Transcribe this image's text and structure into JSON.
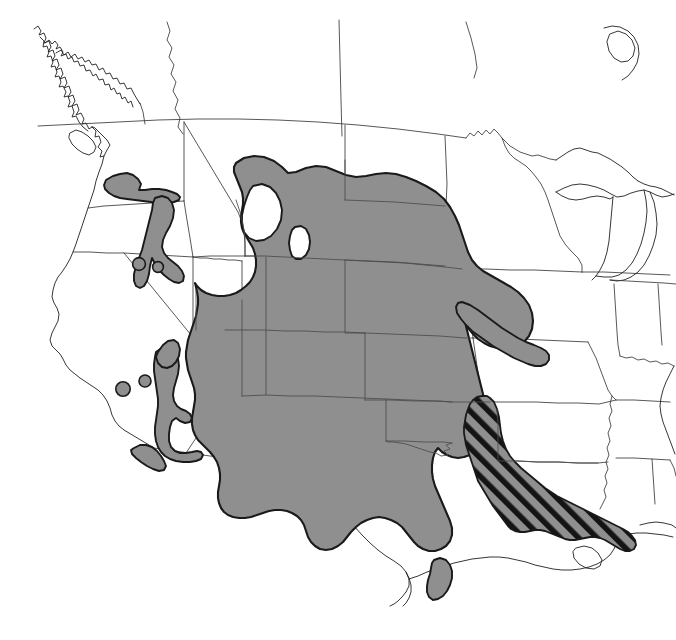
{
  "figure": {
    "kind": "species-range-map",
    "region": "Western and central North America",
    "background_color": "#ffffff",
    "width": 676,
    "height": 640
  },
  "legend_colors": {
    "primary_range_fill": "#8f8f8f",
    "primary_range_outline": "#1a1a1a",
    "hatched_range_fill": "#8f8f8f",
    "hatched_range_hatch": "#1a1a1a",
    "coastline": "#231f20",
    "state_boundary": "#3a3a3a",
    "water_or_gap_fill": "#ffffff"
  },
  "layers": [
    {
      "name": "primary-range",
      "label": "Primary range (solid gray)",
      "fill": "#8f8f8f",
      "description": "Continuous shaded area covering the Great Plains from the Canadian prairie border south through Texas, and west across the Rocky Mountain and Colorado Plateau states."
    },
    {
      "name": "hatched-range",
      "label": "Secondary range (diagonal hatch)",
      "fill": "#8f8f8f",
      "hatch_angle_degrees": 45,
      "description": "Diagonally hatched area covering eastern Texas, Louisiana and the Gulf coastal plain."
    },
    {
      "name": "disjunct-patches",
      "label": "Disjunct populations",
      "fill": "#8f8f8f",
      "description": "Isolated shaded patches in eastern Washington, central Idaho, Nevada, Arizona and northern Mexico."
    },
    {
      "name": "range-gaps",
      "label": "Unoccupied enclaves",
      "fill": "#ffffff",
      "description": "White holes inside the shaded range, including the Black Hills, the Wyoming Basin notch, central Arizona and the Edwards Plateau of Texas."
    },
    {
      "name": "basemap",
      "label": "Political basemap",
      "description": "State, provincial and national boundaries plus coastline of North America."
    }
  ],
  "map_features": {
    "coastlines": [
      "Pacific coast of British Columbia",
      "Vancouver Island",
      "Puget Sound",
      "Gulf of Mexico coast",
      "Great Lakes shoreline",
      "Atlantic seaboard"
    ],
    "boundaries": [
      "United States–Canada border",
      "United States–Mexico border",
      "State and provincial boundaries"
    ],
    "enclaves": [
      "Black Hills",
      "Grand Canyon / Mogollon Rim gap",
      "Edwards Plateau",
      "Wyoming Basin"
    ]
  }
}
